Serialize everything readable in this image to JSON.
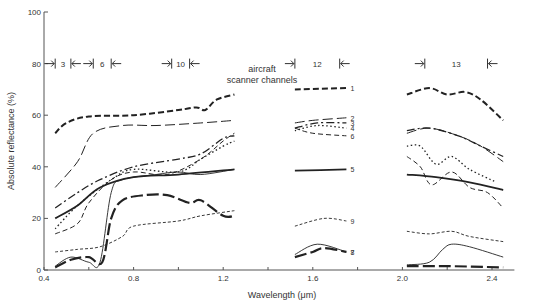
{
  "chart_data": {
    "type": "line",
    "title": "",
    "xlabel": "Wavelength (μm)",
    "ylabel": "Absolute reflectance (%)",
    "xlim": [
      0.4,
      2.5
    ],
    "ylim": [
      0,
      100
    ],
    "x_ticks": [
      "0.4",
      "0.8",
      "1.2",
      "1.6",
      "2.0",
      "2.4"
    ],
    "y_ticks": [
      "0",
      "20",
      "40",
      "60",
      "80",
      "100"
    ],
    "grid": false,
    "annotation": "aircraft scanner channels",
    "channels": [
      {
        "label": "3",
        "from": 0.45,
        "to": 0.52
      },
      {
        "label": "6",
        "from": 0.62,
        "to": 0.7
      },
      {
        "label": "10",
        "from": 0.97,
        "to": 1.05
      },
      {
        "label": "12",
        "from": 1.52,
        "to": 1.72
      },
      {
        "label": "13",
        "from": 2.1,
        "to": 2.38
      }
    ],
    "series": [
      {
        "name": "1",
        "style": "heavy-dash",
        "segments": [
          [
            [
              0.45,
              53
            ],
            [
              0.5,
              57
            ],
            [
              0.6,
              59.5
            ],
            [
              0.8,
              60
            ],
            [
              1.0,
              62
            ],
            [
              1.08,
              63
            ],
            [
              1.12,
              62
            ],
            [
              1.17,
              66
            ],
            [
              1.25,
              68
            ]
          ],
          [
            [
              1.52,
              70
            ],
            [
              1.75,
              70.5
            ]
          ],
          [
            [
              2.02,
              68
            ],
            [
              2.12,
              70.5
            ],
            [
              2.2,
              68
            ],
            [
              2.28,
              69
            ],
            [
              2.35,
              66
            ],
            [
              2.45,
              58
            ]
          ]
        ]
      },
      {
        "name": "2",
        "style": "long-dash",
        "segments": [
          [
            [
              0.45,
              32
            ],
            [
              0.55,
              42
            ],
            [
              0.62,
              53
            ],
            [
              0.75,
              56
            ],
            [
              0.9,
              56
            ],
            [
              1.1,
              57
            ],
            [
              1.25,
              58
            ]
          ],
          [
            [
              1.52,
              57
            ],
            [
              1.6,
              58
            ],
            [
              1.75,
              59
            ]
          ],
          [
            [
              2.02,
              53
            ],
            [
              2.12,
              55
            ],
            [
              2.25,
              52
            ],
            [
              2.35,
              48
            ],
            [
              2.45,
              42
            ]
          ]
        ]
      },
      {
        "name": "3",
        "style": "dash-dot",
        "segments": [
          [
            [
              0.45,
              24
            ],
            [
              0.55,
              30
            ],
            [
              0.65,
              35
            ],
            [
              0.8,
              40
            ],
            [
              1.0,
              43
            ],
            [
              1.1,
              45
            ],
            [
              1.2,
              51
            ],
            [
              1.25,
              52
            ]
          ],
          [
            [
              1.52,
              55
            ],
            [
              1.62,
              57
            ],
            [
              1.75,
              57
            ]
          ],
          [
            [
              2.02,
              54
            ],
            [
              2.12,
              55
            ],
            [
              2.25,
              52
            ],
            [
              2.35,
              48
            ],
            [
              2.45,
              44
            ]
          ]
        ]
      },
      {
        "name": "4",
        "style": "dotted",
        "segments": [
          [
            [
              0.45,
              16
            ],
            [
              0.55,
              25
            ],
            [
              0.7,
              35
            ],
            [
              0.8,
              39
            ],
            [
              1.0,
              38
            ],
            [
              1.1,
              43
            ],
            [
              1.2,
              48
            ],
            [
              1.25,
              50
            ]
          ],
          [
            [
              1.52,
              54
            ],
            [
              1.62,
              56
            ],
            [
              1.75,
              55
            ]
          ],
          [
            [
              2.02,
              48
            ],
            [
              2.08,
              48
            ],
            [
              2.15,
              41
            ],
            [
              2.22,
              44
            ],
            [
              2.3,
              39
            ],
            [
              2.42,
              34
            ]
          ]
        ]
      },
      {
        "name": "5",
        "style": "solid-heavy",
        "segments": [
          [
            [
              0.45,
              20
            ],
            [
              0.55,
              25
            ],
            [
              0.65,
              32
            ],
            [
              0.8,
              36
            ],
            [
              1.0,
              37
            ],
            [
              1.25,
              39
            ]
          ],
          [
            [
              1.52,
              38.5
            ],
            [
              1.75,
              39
            ]
          ],
          [
            [
              2.02,
              37
            ],
            [
              2.15,
              36
            ],
            [
              2.3,
              34
            ],
            [
              2.45,
              31
            ]
          ]
        ]
      },
      {
        "name": "6",
        "style": "dashed",
        "segments": [
          [
            [
              0.45,
              14
            ],
            [
              0.55,
              18
            ],
            [
              0.6,
              26
            ],
            [
              0.7,
              35
            ],
            [
              0.8,
              38
            ],
            [
              0.95,
              37
            ],
            [
              1.1,
              43
            ],
            [
              1.2,
              50
            ],
            [
              1.25,
              53
            ]
          ],
          [
            [
              1.52,
              55
            ],
            [
              1.6,
              53
            ],
            [
              1.75,
              52
            ]
          ],
          [
            [
              2.02,
              44
            ],
            [
              2.08,
              40
            ],
            [
              2.13,
              33
            ],
            [
              2.22,
              38
            ],
            [
              2.3,
              32
            ],
            [
              2.38,
              30
            ],
            [
              2.45,
              24
            ]
          ]
        ]
      },
      {
        "name": "7",
        "style": "thin-solid",
        "segments": [
          [
            [
              0.45,
              1.5
            ],
            [
              0.52,
              5
            ],
            [
              0.6,
              3
            ],
            [
              0.65,
              3
            ],
            [
              0.7,
              30
            ],
            [
              0.75,
              35
            ],
            [
              0.9,
              37
            ],
            [
              1.0,
              38
            ],
            [
              1.1,
              37
            ],
            [
              1.25,
              39
            ]
          ],
          [
            [
              1.52,
              6
            ],
            [
              1.62,
              10
            ],
            [
              1.75,
              7
            ]
          ],
          [
            [
              2.02,
              2
            ],
            [
              2.12,
              3
            ],
            [
              2.18,
              8
            ],
            [
              2.22,
              10
            ],
            [
              2.3,
              9
            ],
            [
              2.45,
              5
            ]
          ]
        ]
      },
      {
        "name": "8",
        "style": "heavy-long-dash",
        "segments": [
          [
            [
              0.45,
              1
            ],
            [
              0.52,
              4
            ],
            [
              0.6,
              5
            ],
            [
              0.66,
              3
            ],
            [
              0.7,
              20
            ],
            [
              0.75,
              27
            ],
            [
              0.85,
              29
            ],
            [
              0.95,
              29
            ],
            [
              1.05,
              26
            ],
            [
              1.1,
              27
            ],
            [
              1.2,
              21
            ],
            [
              1.25,
              21
            ]
          ],
          [
            [
              1.52,
              5
            ],
            [
              1.6,
              7
            ],
            [
              1.65,
              8.5
            ],
            [
              1.75,
              7
            ]
          ],
          [
            [
              2.02,
              1.5
            ],
            [
              2.2,
              1.5
            ],
            [
              2.45,
              1
            ]
          ]
        ]
      },
      {
        "name": "9",
        "style": "short-dash",
        "segments": [
          [
            [
              0.45,
              7
            ],
            [
              0.55,
              8
            ],
            [
              0.65,
              9
            ],
            [
              0.75,
              13
            ],
            [
              0.8,
              17
            ],
            [
              1.0,
              19
            ],
            [
              1.1,
              21
            ],
            [
              1.25,
              23
            ]
          ],
          [
            [
              1.52,
              17
            ],
            [
              1.65,
              20
            ],
            [
              1.75,
              19
            ]
          ],
          [
            [
              2.02,
              15
            ],
            [
              2.12,
              14
            ],
            [
              2.22,
              15
            ],
            [
              2.3,
              13
            ],
            [
              2.45,
              11
            ]
          ]
        ]
      }
    ]
  }
}
